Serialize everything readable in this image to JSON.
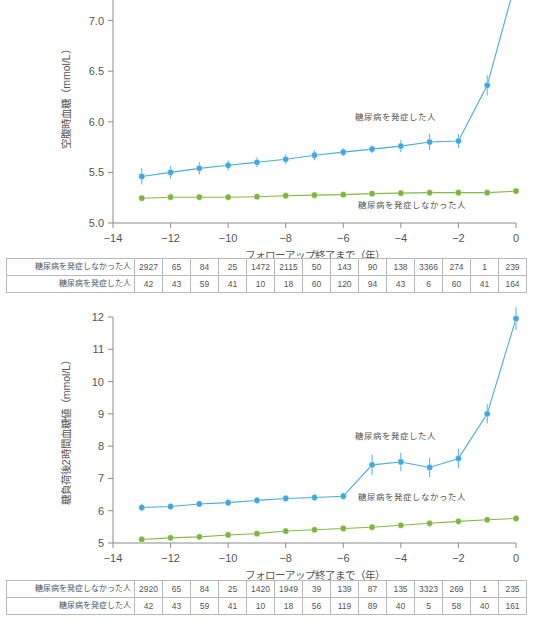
{
  "figure": {
    "series_labels": {
      "incident": "糖尿病を発症した人",
      "non_incident": "糖尿病を発症しなかった人"
    },
    "colors": {
      "incident": "#3fa8dc",
      "non_incident": "#7cb63c",
      "axis": "#8d8d8d",
      "text": "#555555",
      "grid_border": "#b9b9b9"
    },
    "xlabel": "フォローアップ終了まで（年）"
  },
  "chart_data": [
    {
      "type": "line",
      "id": "fasting-plasma-glucose",
      "title": "",
      "ylabel": "空腹時血糖（mmol/L）",
      "xlabel": "フォローアップ終了まで（年）",
      "x": [
        -13,
        -12,
        -11,
        -10,
        -9,
        -8,
        -7,
        -6,
        -5,
        -4,
        -3,
        -2,
        -1,
        0
      ],
      "xlim": [
        -14,
        0
      ],
      "ylim": [
        5.0,
        7.5
      ],
      "yticks": [
        5.0,
        5.5,
        6.0,
        6.5,
        7.0
      ],
      "ytick_labels": [
        "5.0",
        "5.5",
        "6.0",
        "6.5",
        "7.0"
      ],
      "xticks": [
        -14,
        -12,
        -10,
        -8,
        -6,
        -4,
        -2,
        0
      ],
      "xtick_labels": [
        "−14",
        "−12",
        "−10",
        "−8",
        "−6",
        "−4",
        "−2",
        "0"
      ],
      "grid": false,
      "legend_position": "inline-annotation",
      "series": [
        {
          "name": "糖尿病を発症した人",
          "color": "#3fa8dc",
          "values": [
            5.46,
            5.5,
            5.54,
            5.57,
            5.6,
            5.63,
            5.67,
            5.7,
            5.73,
            5.76,
            5.8,
            5.81,
            6.36,
            7.4
          ],
          "err_low": [
            5.38,
            5.44,
            5.48,
            5.52,
            5.55,
            5.58,
            5.62,
            5.66,
            5.69,
            5.7,
            5.72,
            5.74,
            6.26,
            7.26
          ],
          "err_high": [
            5.54,
            5.56,
            5.6,
            5.62,
            5.65,
            5.68,
            5.72,
            5.74,
            5.77,
            5.82,
            5.88,
            5.88,
            6.46,
            7.54
          ]
        },
        {
          "name": "糖尿病を発症しなかった人",
          "color": "#7cb63c",
          "values": [
            5.245,
            5.255,
            5.255,
            5.255,
            5.26,
            5.27,
            5.275,
            5.28,
            5.29,
            5.295,
            5.3,
            5.3,
            5.3,
            5.315
          ],
          "err_low": [
            5.235,
            5.245,
            5.245,
            5.245,
            5.25,
            5.26,
            5.265,
            5.27,
            5.28,
            5.285,
            5.29,
            5.29,
            5.29,
            5.305
          ],
          "err_high": [
            5.255,
            5.265,
            5.265,
            5.265,
            5.27,
            5.28,
            5.285,
            5.29,
            5.3,
            5.305,
            5.31,
            5.31,
            5.31,
            5.325
          ]
        }
      ],
      "annotations": [
        {
          "text": "糖尿病を発症した人",
          "x": -4.2,
          "y": 6.02
        },
        {
          "text": "糖尿病を発症しなかった人",
          "x": -3.6,
          "y": 5.15
        }
      ]
    },
    {
      "type": "line",
      "id": "two-hour-post-load-glucose",
      "title": "",
      "ylabel": "糖負荷後2時間血糖値（mmol/L）",
      "xlabel": "フォローアップ終了まで（年）",
      "x": [
        -13,
        -12,
        -11,
        -10,
        -9,
        -8,
        -7,
        -6,
        -5,
        -4,
        -3,
        -2,
        -1,
        0
      ],
      "xlim": [
        -14,
        0
      ],
      "ylim": [
        5,
        12
      ],
      "yticks": [
        5,
        6,
        7,
        8,
        9,
        10,
        11,
        12
      ],
      "ytick_labels": [
        "5",
        "6",
        "7",
        "8",
        "9",
        "10",
        "11",
        "12"
      ],
      "xticks": [
        -14,
        -12,
        -10,
        -8,
        -6,
        -4,
        -2,
        0
      ],
      "xtick_labels": [
        "−14",
        "−12",
        "−10",
        "−8",
        "−6",
        "−4",
        "−2",
        "0"
      ],
      "grid": false,
      "legend_position": "inline-annotation",
      "series": [
        {
          "name": "糖尿病を発症した人",
          "color": "#3fa8dc",
          "values": [
            6.1,
            6.13,
            6.21,
            6.25,
            6.32,
            6.38,
            6.41,
            6.45,
            7.42,
            7.51,
            7.34,
            7.62,
            9.0,
            11.95
          ],
          "err_low": [
            5.98,
            6.03,
            6.11,
            6.14,
            6.22,
            6.28,
            6.3,
            6.34,
            7.1,
            7.22,
            7.04,
            7.32,
            8.7,
            11.6
          ],
          "err_high": [
            6.22,
            6.23,
            6.31,
            6.36,
            6.42,
            6.48,
            6.52,
            6.56,
            7.74,
            7.8,
            7.64,
            7.92,
            9.3,
            12.3
          ]
        },
        {
          "name": "糖尿病を発症しなかった人",
          "color": "#7cb63c",
          "values": [
            5.11,
            5.16,
            5.19,
            5.25,
            5.29,
            5.37,
            5.41,
            5.45,
            5.49,
            5.55,
            5.61,
            5.67,
            5.72,
            5.76
          ],
          "err_low": [
            5.05,
            5.11,
            5.14,
            5.2,
            5.24,
            5.32,
            5.36,
            5.4,
            5.43,
            5.49,
            5.55,
            5.61,
            5.66,
            5.7
          ],
          "err_high": [
            5.17,
            5.21,
            5.24,
            5.3,
            5.34,
            5.42,
            5.46,
            5.5,
            5.55,
            5.61,
            5.67,
            5.73,
            5.78,
            5.82
          ]
        }
      ],
      "annotations": [
        {
          "text": "糖尿病を発症した人",
          "x": -4.2,
          "y": 8.22
        },
        {
          "text": "糖尿病を発症しなかった人",
          "x": -3.6,
          "y": 6.32
        }
      ]
    }
  ],
  "tables": [
    {
      "id": "risk-table-1",
      "rows": [
        {
          "label": "糖尿病を発症しなかった人",
          "cells": [
            "2927",
            "65",
            "84",
            "25",
            "1472",
            "2115",
            "50",
            "143",
            "90",
            "138",
            "3366",
            "274",
            "1",
            "239"
          ]
        },
        {
          "label": "糖尿病を発症した人",
          "cells": [
            "42",
            "43",
            "59",
            "41",
            "10",
            "18",
            "60",
            "120",
            "94",
            "43",
            "6",
            "60",
            "41",
            "164"
          ]
        }
      ]
    },
    {
      "id": "risk-table-2",
      "rows": [
        {
          "label": "糖尿病を発症しなかった人",
          "cells": [
            "2920",
            "65",
            "84",
            "25",
            "1420",
            "1949",
            "39",
            "139",
            "87",
            "135",
            "3323",
            "269",
            "1",
            "235"
          ]
        },
        {
          "label": "糖尿病を発症した人",
          "cells": [
            "42",
            "43",
            "59",
            "41",
            "10",
            "18",
            "56",
            "119",
            "89",
            "40",
            "5",
            "58",
            "40",
            "161"
          ]
        }
      ]
    }
  ]
}
